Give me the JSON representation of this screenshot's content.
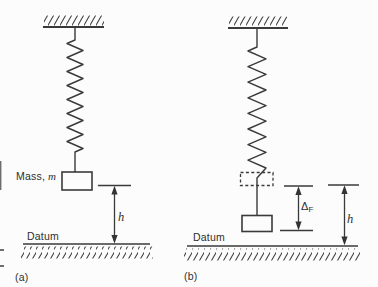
{
  "figure": {
    "ink_color": "#3a3a3a",
    "background_color": "#fcfcfc"
  },
  "diagram_a": {
    "caption": "(a)",
    "mass_label": {
      "prefix": "Mass,",
      "symbol": "m"
    },
    "datum_label": "Datum",
    "height_label": "h"
  },
  "diagram_b": {
    "caption": "(b)",
    "datum_label": "Datum",
    "height_label": "h",
    "deflection_label": {
      "base": "Δ",
      "sub": "F"
    }
  }
}
